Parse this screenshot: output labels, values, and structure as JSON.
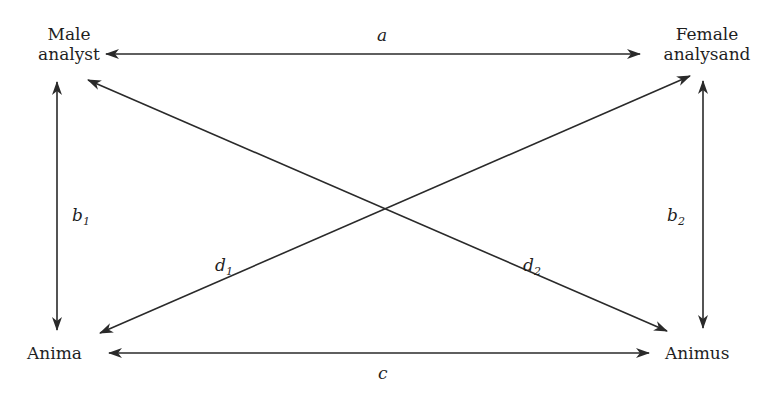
{
  "diagram": {
    "type": "relationship-diagram",
    "nodes": {
      "male_analyst": {
        "lines": [
          "Male",
          "analyst"
        ]
      },
      "female_analysand": {
        "lines": [
          "Female",
          "analysand"
        ]
      },
      "anima": {
        "lines": [
          "Anima"
        ]
      },
      "animus": {
        "lines": [
          "Animus"
        ]
      }
    },
    "edges": {
      "a": {
        "letter": "a",
        "subscript": "",
        "from": "Male analyst",
        "to": "Female analysand",
        "direction": "bidirectional"
      },
      "b1": {
        "letter": "b",
        "subscript": "1",
        "from": "Male analyst",
        "to": "Anima",
        "direction": "bidirectional"
      },
      "b2": {
        "letter": "b",
        "subscript": "2",
        "from": "Female analysand",
        "to": "Animus",
        "direction": "bidirectional"
      },
      "c": {
        "letter": "c",
        "subscript": "",
        "from": "Anima",
        "to": "Animus",
        "direction": "bidirectional"
      },
      "d1": {
        "letter": "d",
        "subscript": "1",
        "from": "Anima",
        "to": "Female analysand",
        "direction": "bidirectional"
      },
      "d2": {
        "letter": "d",
        "subscript": "2",
        "from": "Male analyst",
        "to": "Animus",
        "direction": "bidirectional"
      }
    },
    "colors": {
      "line": "#2a2a2a",
      "text": "#1f1f1f",
      "background": "#ffffff"
    }
  }
}
